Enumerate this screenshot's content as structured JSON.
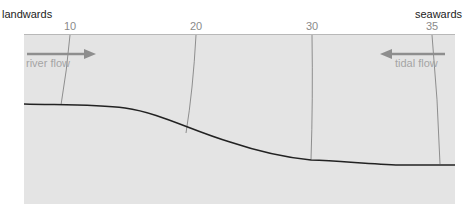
{
  "diagram": {
    "left_label": "landwards",
    "right_label": "seawards",
    "salinity_lines": [
      {
        "value": "10",
        "x_top": 70,
        "x_bottom": 60
      },
      {
        "value": "20",
        "x_top": 196,
        "x_bottom": 186
      },
      {
        "value": "30",
        "x_top": 312,
        "x_bottom": 311
      },
      {
        "value": "35",
        "x_top": 432,
        "x_bottom": 440
      }
    ],
    "flows": [
      {
        "label": "river flow",
        "direction": "right"
      },
      {
        "label": "tidal flow",
        "direction": "left"
      }
    ],
    "colors": {
      "panel": "#e4e4e4",
      "bed_line": "#222222",
      "arrow": "#8e8e8e",
      "isohaline": "#777777"
    }
  }
}
